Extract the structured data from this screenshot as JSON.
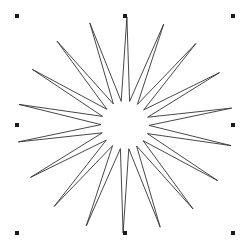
{
  "canvas": {
    "width": 250,
    "height": 249,
    "background": "#ffffff"
  },
  "shape": {
    "type": "star",
    "points": 18,
    "center": [
      125,
      125
    ],
    "outer_radius": 108,
    "inner_radius": 24,
    "rotation_deg": -89,
    "stroke": "#333333",
    "fill": "none",
    "stroke_width": 0.9,
    "selected": true
  },
  "selection_handles": {
    "color": "#1a1a1a",
    "size": 4,
    "positions": [
      {
        "name": "top-left",
        "x": 17,
        "y": 16
      },
      {
        "name": "top-center",
        "x": 125,
        "y": 16
      },
      {
        "name": "top-right",
        "x": 233,
        "y": 16
      },
      {
        "name": "middle-left",
        "x": 17,
        "y": 125
      },
      {
        "name": "middle-right",
        "x": 233,
        "y": 125
      },
      {
        "name": "bottom-left",
        "x": 17,
        "y": 233
      },
      {
        "name": "bottom-center",
        "x": 125,
        "y": 233
      },
      {
        "name": "bottom-right",
        "x": 233,
        "y": 233
      }
    ]
  }
}
